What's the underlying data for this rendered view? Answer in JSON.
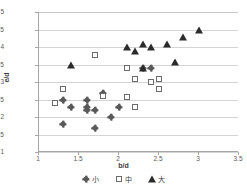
{
  "chart_data": {
    "type": "scatter",
    "title": "",
    "xlabel": "b/d",
    "ylabel": "e/d",
    "xlim": [
      1,
      3.5
    ],
    "ylim": [
      1,
      5
    ],
    "xticks": [
      "1",
      "1.5",
      "2",
      "2.5",
      "3",
      "3.5"
    ],
    "xtick_values": [
      1,
      1.5,
      2,
      2.5,
      3,
      3.5
    ],
    "yticks": [
      "1",
      "1.5",
      "2",
      "2.5",
      "3",
      "3.5",
      "4",
      "4.5",
      "5"
    ],
    "ytick_values": [
      1,
      1.5,
      2,
      2.5,
      3,
      3.5,
      4,
      4.5,
      5
    ],
    "grid": true,
    "grid_axis": "y",
    "legend_position": "bottom",
    "series": [
      {
        "name": "小",
        "marker": "diamond",
        "color": "#595959",
        "points": [
          [
            1.3,
            2.5
          ],
          [
            1.3,
            1.8
          ],
          [
            1.4,
            2.3
          ],
          [
            1.6,
            2.5
          ],
          [
            1.6,
            2.28
          ],
          [
            1.6,
            2.2
          ],
          [
            1.7,
            2.2
          ],
          [
            1.7,
            1.7
          ],
          [
            1.8,
            2.68
          ],
          [
            1.9,
            2.0
          ],
          [
            2.0,
            2.3
          ],
          [
            2.3,
            3.4
          ],
          [
            2.4,
            3.4
          ]
        ]
      },
      {
        "name": "中",
        "marker": "square",
        "color": "#6b6b6b",
        "points": [
          [
            1.2,
            2.4
          ],
          [
            1.3,
            2.8
          ],
          [
            1.7,
            3.78
          ],
          [
            1.8,
            2.6
          ],
          [
            2.1,
            3.4
          ],
          [
            2.1,
            2.58
          ],
          [
            2.2,
            3.08
          ],
          [
            2.2,
            2.3
          ],
          [
            2.4,
            3.0
          ],
          [
            2.5,
            3.08
          ],
          [
            2.5,
            2.8
          ]
        ]
      },
      {
        "name": "大",
        "marker": "triangle",
        "color": "#2b2b2b",
        "points": [
          [
            1.4,
            3.48
          ],
          [
            2.1,
            4.0
          ],
          [
            2.2,
            3.9
          ],
          [
            2.3,
            4.1
          ],
          [
            2.3,
            3.4
          ],
          [
            2.4,
            4.0
          ],
          [
            2.6,
            4.08
          ],
          [
            2.7,
            3.58
          ],
          [
            2.8,
            4.28
          ],
          [
            3.0,
            4.48
          ]
        ]
      }
    ]
  }
}
